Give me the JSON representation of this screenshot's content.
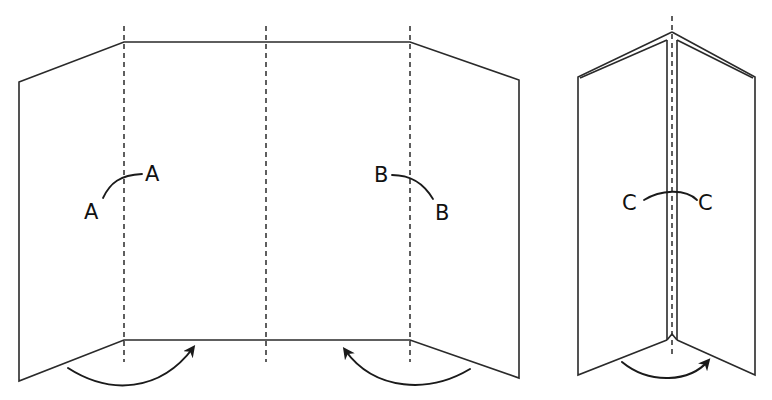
{
  "diagram": {
    "type": "folding-instruction",
    "colors": {
      "line": "#2a2a2a",
      "background": "#ffffff"
    },
    "figure_left": {
      "description": "Four-panel folding screen unfolded, with three dashed fold lines and two curved arrows indicating side panels folding inward",
      "labels": {
        "a1": "A",
        "a2": "A",
        "b1": "B",
        "b2": "B"
      },
      "fold_lines": 3,
      "arrows": [
        "fold-left-panel-inward",
        "fold-right-panel-inward"
      ]
    },
    "figure_right": {
      "description": "Folded panels meeting at a central dashed spine, with arrow indicating closing motion",
      "labels": {
        "c1": "C",
        "c2": "C"
      },
      "fold_lines": 1,
      "arrows": [
        "fold-closed"
      ]
    }
  }
}
